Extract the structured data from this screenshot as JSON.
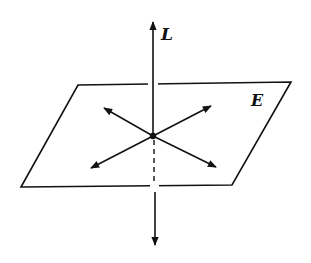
{
  "diagram": {
    "labels": {
      "line": "L",
      "plane": "E"
    },
    "colors": {
      "ink": "#111111",
      "background": "#ffffff"
    },
    "plane": {
      "corners": [
        [
          78,
          85
        ],
        [
          291,
          82
        ],
        [
          232,
          185
        ],
        [
          21,
          187
        ]
      ]
    },
    "intersection_point": [
      153,
      136
    ],
    "line_L": {
      "top_tip": [
        153,
        20
      ],
      "bottom_tip": [
        155,
        247
      ],
      "hidden_segment": "dashed from intersection to plane lower edge"
    },
    "in_plane_vectors": [
      {
        "name": "upper-left",
        "tip": [
          103,
          108
        ]
      },
      {
        "name": "upper-right",
        "tip": [
          212,
          105
        ]
      },
      {
        "name": "lower-left",
        "tip": [
          90,
          169
        ]
      },
      {
        "name": "lower-right",
        "tip": [
          217,
          168
        ]
      }
    ]
  }
}
